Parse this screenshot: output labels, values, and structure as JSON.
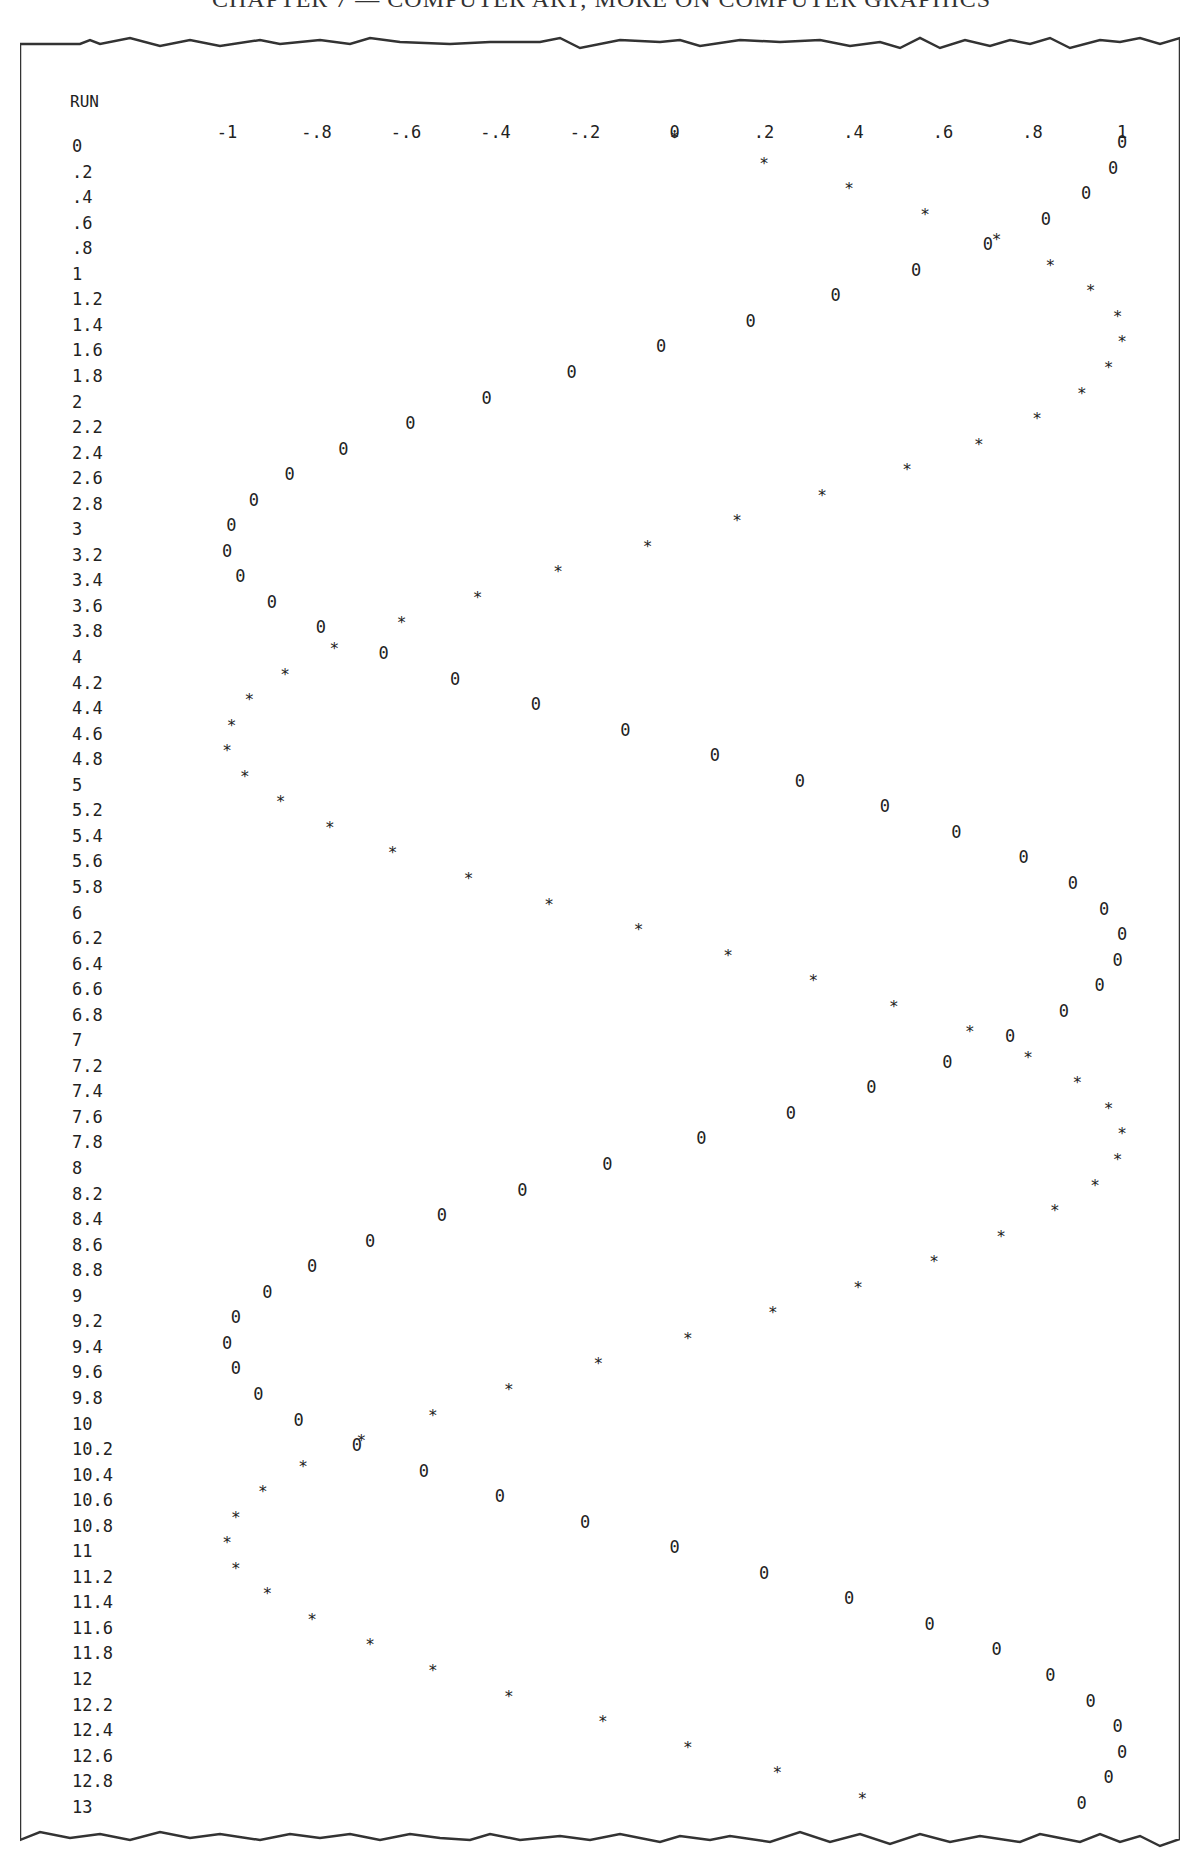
{
  "page": {
    "header": "CHAPTER 7 — COMPUTER ART; MORE ON COMPUTER GRAPHICS"
  },
  "plot": {
    "run_label": "RUN",
    "ticks": [
      "-1",
      "-.8",
      "-.6",
      "-.4",
      "-.2",
      "0",
      ".2",
      ".4",
      ".6",
      ".8",
      "1"
    ],
    "sin_symbol": "*",
    "cos_symbol": "0"
  },
  "chart_data": {
    "type": "scatter",
    "title": "",
    "xlabel": "",
    "ylabel": "RUN",
    "xlim": [
      -1,
      1
    ],
    "ylim": [
      0,
      13
    ],
    "orientation": "rows are RUN values (top to bottom), columns are function value",
    "x_ticks": [
      -1,
      -0.8,
      -0.6,
      -0.4,
      -0.2,
      0,
      0.2,
      0.4,
      0.6,
      0.8,
      1
    ],
    "grid": false,
    "run": [
      0,
      0.2,
      0.4,
      0.6,
      0.8,
      1,
      1.2,
      1.4,
      1.6,
      1.8,
      2,
      2.2,
      2.4,
      2.6,
      2.8,
      3,
      3.2,
      3.4,
      3.6,
      3.8,
      4,
      4.2,
      4.4,
      4.6,
      4.8,
      5,
      5.2,
      5.4,
      5.6,
      5.8,
      6,
      6.2,
      6.4,
      6.6,
      6.8,
      7,
      7.2,
      7.4,
      7.6,
      7.8,
      8,
      8.2,
      8.4,
      8.6,
      8.8,
      9,
      9.2,
      9.4,
      9.6,
      9.8,
      10,
      10.2,
      10.4,
      10.6,
      10.8,
      11,
      11.2,
      11.4,
      11.6,
      11.8,
      12,
      12.2,
      12.4,
      12.6,
      12.8,
      13
    ],
    "run_labels": [
      "0",
      ".2",
      ".4",
      ".6",
      ".8",
      "1",
      "1.2",
      "1.4",
      "1.6",
      "1.8",
      "2",
      "2.2",
      "2.4",
      "2.6",
      "2.8",
      "3",
      "3.2",
      "3.4",
      "3.6",
      "3.8",
      "4",
      "4.2",
      "4.4",
      "4.6",
      "4.8",
      "5",
      "5.2",
      "5.4",
      "5.6",
      "5.8",
      "6",
      "6.2",
      "6.4",
      "6.6",
      "6.8",
      "7",
      "7.2",
      "7.4",
      "7.6",
      "7.8",
      "8",
      "8.2",
      "8.4",
      "8.6",
      "8.8",
      "9",
      "9.2",
      "9.4",
      "9.6",
      "9.8",
      "10",
      "10.2",
      "10.4",
      "10.6",
      "10.8",
      "11",
      "11.2",
      "11.4",
      "11.6",
      "11.8",
      "12",
      "12.2",
      "12.4",
      "12.6",
      "12.8",
      "13"
    ],
    "series": [
      {
        "name": "SIN (*)",
        "symbol": "*",
        "values": [
          0,
          0.2,
          0.39,
          0.56,
          0.72,
          0.84,
          0.93,
          0.99,
          1.0,
          0.97,
          0.91,
          0.81,
          0.68,
          0.52,
          0.33,
          0.14,
          -0.06,
          -0.26,
          -0.44,
          -0.61,
          -0.76,
          -0.87,
          -0.95,
          -0.99,
          -1.0,
          -0.96,
          -0.88,
          -0.77,
          -0.63,
          -0.46,
          -0.28,
          -0.08,
          0.12,
          0.31,
          0.49,
          0.66,
          0.79,
          0.9,
          0.97,
          1.0,
          0.99,
          0.94,
          0.85,
          0.73,
          0.58,
          0.41,
          0.22,
          0.03,
          -0.17,
          -0.37,
          -0.54,
          -0.7,
          -0.83,
          -0.92,
          -0.98,
          -1.0,
          -0.98,
          -0.91,
          -0.81,
          -0.68,
          -0.54,
          -0.37,
          -0.16,
          0.03,
          0.23,
          0.42
        ]
      },
      {
        "name": "COS (0)",
        "symbol": "0",
        "values": [
          1,
          0.98,
          0.92,
          0.83,
          0.7,
          0.54,
          0.36,
          0.17,
          -0.03,
          -0.23,
          -0.42,
          -0.59,
          -0.74,
          -0.86,
          -0.94,
          -0.99,
          -1.0,
          -0.97,
          -0.9,
          -0.79,
          -0.65,
          -0.49,
          -0.31,
          -0.11,
          0.09,
          0.28,
          0.47,
          0.63,
          0.78,
          0.89,
          0.96,
          1.0,
          0.99,
          0.95,
          0.87,
          0.75,
          0.61,
          0.44,
          0.26,
          0.06,
          -0.15,
          -0.34,
          -0.52,
          -0.68,
          -0.81,
          -0.91,
          -0.98,
          -1.0,
          -0.98,
          -0.93,
          -0.84,
          -0.71,
          -0.56,
          -0.39,
          -0.2,
          0.0,
          0.2,
          0.39,
          0.57,
          0.72,
          0.84,
          0.93,
          0.99,
          1.0,
          0.97,
          0.91
        ]
      }
    ]
  }
}
